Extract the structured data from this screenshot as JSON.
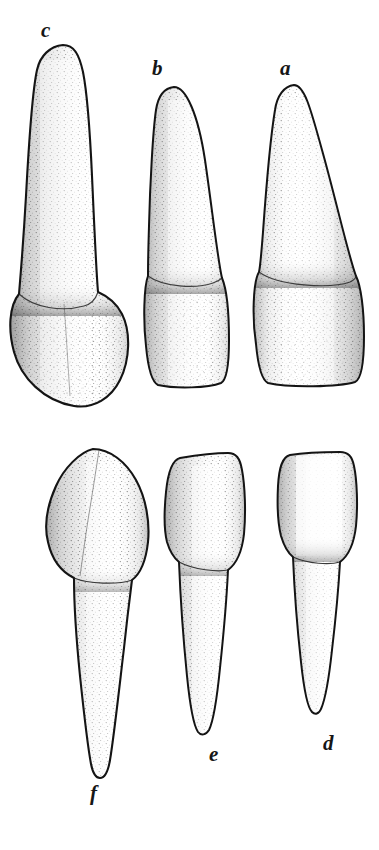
{
  "figure": {
    "kind": "anatomical-line-drawing",
    "background_color": "#ffffff",
    "ink_color": "#1a1a1a",
    "stipple_color": "#2b2b2b",
    "width": 379,
    "height": 850,
    "rows": 2,
    "specimens_per_row": 3
  },
  "labels": {
    "a": "a",
    "b": "b",
    "c": "c",
    "d": "d",
    "e": "e",
    "f": "f"
  },
  "specimens": [
    {
      "id": "c",
      "label": "c",
      "row": "upper",
      "position_in_row": 1,
      "label_x": 41,
      "label_y": 20,
      "bbox": {
        "x": 12,
        "y": 44,
        "w": 120,
        "h": 366
      }
    },
    {
      "id": "b",
      "label": "b",
      "row": "upper",
      "position_in_row": 2,
      "label_x": 152,
      "label_y": 58,
      "bbox": {
        "x": 146,
        "y": 86,
        "w": 84,
        "h": 302
      }
    },
    {
      "id": "a",
      "label": "a",
      "row": "upper",
      "position_in_row": 3,
      "label_x": 280,
      "label_y": 58,
      "bbox": {
        "x": 256,
        "y": 84,
        "w": 108,
        "h": 304
      }
    },
    {
      "id": "f",
      "label": "f",
      "row": "lower",
      "position_in_row": 1,
      "label_x": 90,
      "label_y": 783,
      "bbox": {
        "x": 44,
        "y": 448,
        "w": 106,
        "h": 330
      }
    },
    {
      "id": "e",
      "label": "e",
      "row": "lower",
      "position_in_row": 2,
      "label_x": 209,
      "label_y": 744,
      "bbox": {
        "x": 164,
        "y": 452,
        "w": 96,
        "h": 284
      }
    },
    {
      "id": "d",
      "label": "d",
      "row": "lower",
      "position_in_row": 3,
      "label_x": 323,
      "label_y": 733,
      "bbox": {
        "x": 276,
        "y": 452,
        "w": 90,
        "h": 266
      }
    }
  ]
}
